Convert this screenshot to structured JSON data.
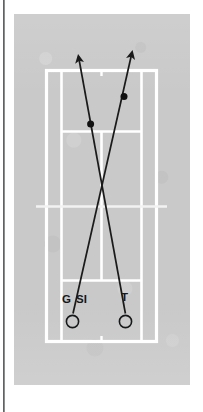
{
  "figure": {
    "kind": "tennis-court-tactical-diagram",
    "title": "",
    "orientation": "portrait-half-court-view",
    "colors": {
      "plate_background": "#c9c9c9",
      "court_lines": "#ffffff",
      "trajectory": "#1a1a1a",
      "label_text": "#16181a",
      "page_rule": "#5f6164"
    }
  },
  "court": {
    "name": "tennis-court",
    "lines": [
      "outer-doubles-boundary",
      "left-singles-sideline",
      "right-singles-sideline",
      "far-baseline",
      "near-baseline",
      "far-service-line",
      "near-service-line",
      "centre-service-line",
      "net-line",
      "far-centre-mark",
      "near-centre-mark"
    ]
  },
  "players": [
    {
      "id": "G",
      "label": "G",
      "marker": "open-circle",
      "position": "near-baseline-left-of-centre"
    },
    {
      "id": "SI",
      "label": "SI",
      "marker": "open-circle",
      "position": "near-baseline-left-of-centre"
    },
    {
      "id": "T",
      "label": "T",
      "marker": "open-circle",
      "position": "near-baseline-right-of-centre"
    }
  ],
  "trajectories": [
    {
      "id": "shot-from-T",
      "from": "T",
      "to": "far-court-left",
      "arrowhead": "at-far-end",
      "contact_dot": "one",
      "direction": "cross-court"
    },
    {
      "id": "shot-from-G-SI",
      "from": "G / SI",
      "to": "far-court-right",
      "arrowhead": "at-far-end",
      "contact_dot": "one",
      "direction": "cross-court"
    }
  ],
  "labels": {
    "g": "G",
    "slash": "/",
    "si": "SI",
    "t": "T"
  }
}
